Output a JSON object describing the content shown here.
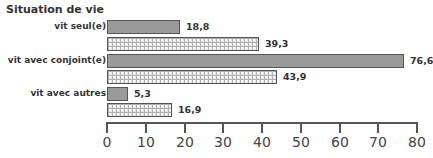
{
  "chart_data": {
    "type": "bar",
    "orientation": "horizontal",
    "title": "Situation de vie",
    "categories": [
      "vit seul(e)",
      "vit avec conjoint(e)",
      "vit avec autres"
    ],
    "series": [
      {
        "name": "série 1 (gris uni)",
        "pattern": "solid",
        "values": [
          18.8,
          76.6,
          5.3
        ],
        "labels": [
          "18,8",
          "76,6",
          "5,3"
        ]
      },
      {
        "name": "série 2 (motif)",
        "pattern": "hatched",
        "values": [
          39.3,
          43.9,
          16.9
        ],
        "labels": [
          "39,3",
          "43,9",
          "16,9"
        ]
      }
    ],
    "xlim": [
      0,
      80
    ],
    "xticks": [
      "0",
      "10",
      "20",
      "30",
      "40",
      "50",
      "60",
      "70",
      "80"
    ],
    "xlabel": "",
    "ylabel": "",
    "grid": false,
    "legend": null,
    "colors": {
      "solid": "#9a9a9a",
      "pattern_bg": "#e6e6e6",
      "border": "#555555"
    }
  }
}
